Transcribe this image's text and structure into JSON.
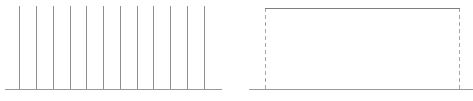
{
  "figure": {
    "width": 473,
    "height": 101,
    "background": "#ffffff",
    "panel_count": 2
  },
  "colors": {
    "axis": "#9a9a9a",
    "impulse": "#8e8e8e",
    "pulse_top": "#7d7d7d",
    "pulse_edge": "#a8a8a8"
  },
  "chart_data": [
    {
      "type": "bar",
      "id": "impulse-train",
      "title": "",
      "subtitle": "",
      "xlabel": "",
      "ylabel": "",
      "categories": [
        "1",
        "2",
        "3",
        "4",
        "5",
        "6",
        "7",
        "8",
        "9",
        "10",
        "11",
        "12"
      ],
      "values": [
        1,
        1,
        1,
        1,
        1,
        1,
        1,
        1,
        1,
        1,
        1,
        1
      ],
      "x": [
        19,
        36,
        53,
        70,
        86,
        103,
        120,
        137,
        153,
        170,
        187,
        204
      ],
      "xlim": [
        5,
        222
      ],
      "ylim": [
        0,
        1
      ],
      "grid": false,
      "legend": null,
      "annotations": [],
      "axis": {
        "baseline_y": 89,
        "baseline_x_start": 5,
        "baseline_x_end": 222,
        "ticks": [],
        "ticklabels": []
      },
      "style": {
        "impulse_top_y": 6,
        "impulse_width_px": 1.6,
        "line_style": "solid"
      }
    },
    {
      "type": "line",
      "id": "rectangular-pulse",
      "title": "",
      "subtitle": "",
      "xlabel": "",
      "ylabel": "",
      "x": [
        13,
        29,
        223,
        237
      ],
      "values": [
        0,
        1,
        1,
        0
      ],
      "xlim": [
        13,
        237
      ],
      "ylim": [
        0,
        1
      ],
      "grid": false,
      "legend": null,
      "annotations": [],
      "axis": {
        "baseline_y": 89,
        "baseline_x_start": 13,
        "baseline_x_end": 237,
        "ticks": [],
        "ticklabels": []
      },
      "style": {
        "pulse_top_y": 8,
        "pulse_left_x": 29,
        "pulse_right_x": 223,
        "top_line_style": "solid",
        "edge_line_style": "dashed",
        "edge_dash_pattern": "4 3"
      }
    }
  ]
}
